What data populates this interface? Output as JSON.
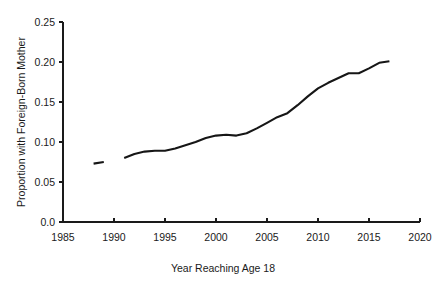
{
  "chart_data": {
    "type": "line",
    "title": "",
    "xlabel": "Year Reaching Age 18",
    "ylabel": "Proportion with Foreign-Born Mother",
    "xlim": [
      1985,
      2020
    ],
    "ylim": [
      0.0,
      0.25
    ],
    "xticks": [
      1985,
      1990,
      1995,
      2000,
      2005,
      2010,
      2015,
      2020
    ],
    "xtick_labels": [
      "1985",
      "1990",
      "1995",
      "2000",
      "2005",
      "2010",
      "2015",
      "2020"
    ],
    "yticks": [
      0.0,
      0.05,
      0.1,
      0.15,
      0.2,
      0.25
    ],
    "ytick_labels": [
      "0.0",
      "0.05",
      "0.10",
      "0.15",
      "0.20",
      "0.25"
    ],
    "grid": false,
    "legend": false,
    "line_color": "#161616",
    "series": [
      {
        "name": "Proportion with Foreign-Born Mother",
        "x": [
          1988,
          1989
        ],
        "values": [
          0.073,
          0.075
        ]
      },
      {
        "name": "Proportion with Foreign-Born Mother",
        "x": [
          1991,
          1992,
          1993,
          1994,
          1995,
          1996,
          1997,
          1998,
          1999,
          2000,
          2001,
          2002,
          2003,
          2004,
          2005,
          2006,
          2007,
          2008,
          2009,
          2010,
          2011,
          2012,
          2013,
          2014,
          2015,
          2016,
          2017
        ],
        "values": [
          0.08,
          0.085,
          0.088,
          0.089,
          0.089,
          0.092,
          0.096,
          0.1,
          0.105,
          0.108,
          0.109,
          0.108,
          0.111,
          0.117,
          0.124,
          0.131,
          0.136,
          0.146,
          0.157,
          0.167,
          0.174,
          0.18,
          0.186,
          0.186,
          0.192,
          0.199,
          0.201
        ]
      }
    ]
  },
  "axis_titles": {
    "x": "Year Reaching Age 18",
    "y": "Proportion with Foreign-Born Mother"
  }
}
